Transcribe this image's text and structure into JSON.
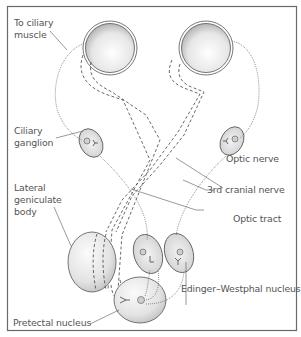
{
  "diagram": {
    "labels": {
      "ciliary_muscle_line1": "To ciliary",
      "ciliary_muscle_line2": "muscle",
      "ciliary_ganglion_line1": "Ciliary",
      "ciliary_ganglion_line2": "ganglion",
      "lateral_geniculate_line1": "Lateral",
      "lateral_geniculate_line2": "geniculate",
      "lateral_geniculate_line3": "body",
      "optic_nerve": "Optic nerve",
      "third_cranial_nerve": "3rd cranial nerve",
      "optic_tract": "Optic tract",
      "edinger_westphal": "Edinger–Westphal nucleus",
      "pretectal_nucleus": "Pretectal nucleus"
    },
    "structures": [
      "left-eye",
      "right-eye",
      "left-ciliary-ganglion",
      "right-ciliary-ganglion",
      "lateral-geniculate-body",
      "left-edinger-westphal-nucleus",
      "right-edinger-westphal-nucleus",
      "pretectal-nucleus"
    ],
    "colors": {
      "frame": "#6a6a6a",
      "line": "#444444",
      "text": "#555555",
      "organ_light": "#ffffff",
      "organ_dark": "#a8a8a8"
    }
  }
}
